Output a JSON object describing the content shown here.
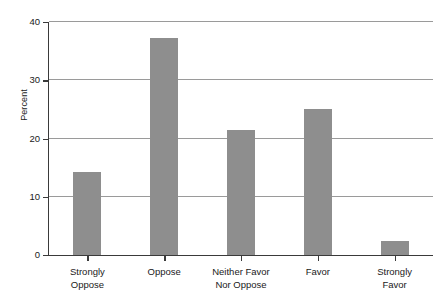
{
  "chart_data": {
    "type": "bar",
    "title": "",
    "subtitle": "",
    "xlabel": "",
    "ylabel": "Percent",
    "categories": [
      "Strongly\nOppose",
      "Oppose",
      "Neither Favor\nNor Oppose",
      "Favor",
      "Strongly\nFavor"
    ],
    "values": [
      14.2,
      37.2,
      21.4,
      25.0,
      2.4
    ],
    "ylim": [
      0,
      40
    ],
    "yticks": [
      0,
      10,
      20,
      30,
      40
    ],
    "ytick_labels": [
      "0",
      "10",
      "20",
      "30",
      "40"
    ],
    "grid": true,
    "grid_axis": "y",
    "legend": false,
    "bar_color": "#8e8e8e",
    "axis_color": "#3a3a3a",
    "grid_color": "#9a9a9a",
    "background": "#ffffff"
  }
}
